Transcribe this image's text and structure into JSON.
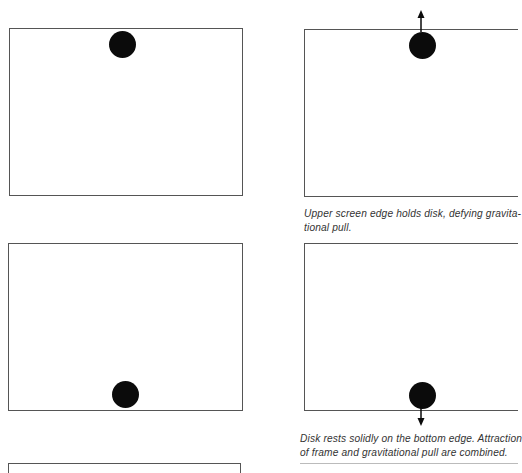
{
  "panels": [
    {
      "id": "panel-1",
      "disk_position": "top",
      "arrow": "none",
      "caption": ""
    },
    {
      "id": "panel-2",
      "disk_position": "top",
      "arrow": "up",
      "caption_lines": [
        "Upper screen edge holds disk, defying gravita-",
        "tional pull."
      ]
    },
    {
      "id": "panel-3",
      "disk_position": "bottom",
      "arrow": "none",
      "caption": ""
    },
    {
      "id": "panel-4",
      "disk_position": "bottom",
      "arrow": "down",
      "caption_lines": [
        "Disk rests solidly on the bottom edge. Attraction",
        "of frame and gravitational pull are combined."
      ]
    },
    {
      "id": "panel-5",
      "disk_position": "",
      "arrow": "none",
      "caption": ""
    }
  ],
  "colors": {
    "frame": "#555555",
    "disk": "#0b0b0b",
    "caption": "#333333",
    "background": "#ffffff"
  }
}
